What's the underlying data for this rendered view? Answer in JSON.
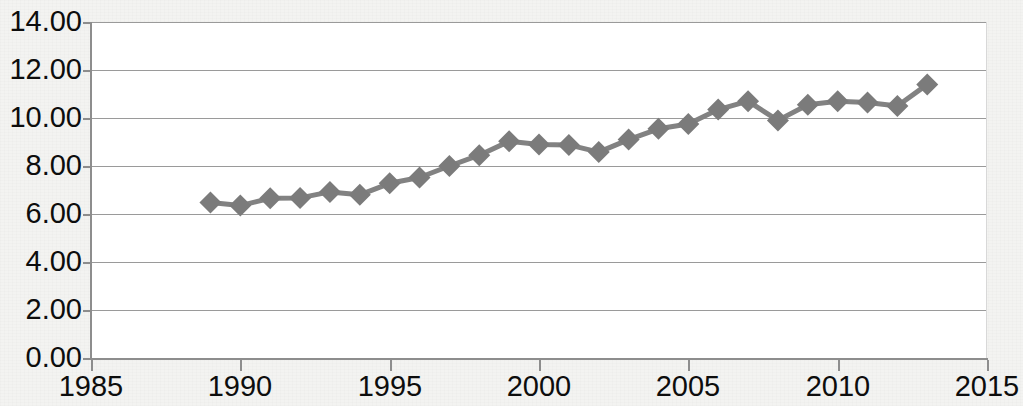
{
  "chart_data": {
    "type": "line",
    "title": "",
    "xlabel": "",
    "ylabel": "",
    "xlim": [
      1985,
      2015
    ],
    "ylim": [
      0,
      14
    ],
    "y_tick_labels": [
      "0.00",
      "2.00",
      "4.00",
      "6.00",
      "8.00",
      "10.00",
      "12.00",
      "14.00"
    ],
    "y_ticks": [
      0,
      2,
      4,
      6,
      8,
      10,
      12,
      14
    ],
    "x_tick_labels": [
      "1985",
      "1990",
      "1995",
      "2000",
      "2005",
      "2010",
      "2015"
    ],
    "x_ticks": [
      1985,
      1990,
      1995,
      2000,
      2005,
      2010,
      2015
    ],
    "grid": "horizontal",
    "legend": "none",
    "marker": "diamond",
    "series_color": "#7b7b7b",
    "line_color": "#828282",
    "series": [
      {
        "name": "series-1",
        "x": [
          1989,
          1990,
          1991,
          1992,
          1993,
          1994,
          1995,
          1996,
          1997,
          1998,
          1999,
          2000,
          2001,
          2002,
          2003,
          2004,
          2005,
          2006,
          2007,
          2008,
          2009,
          2010,
          2011,
          2012,
          2013
        ],
        "values": [
          6.48,
          6.35,
          6.66,
          6.67,
          6.92,
          6.8,
          7.28,
          7.52,
          8.0,
          8.45,
          9.03,
          8.9,
          8.88,
          8.58,
          9.1,
          9.55,
          9.75,
          10.35,
          10.7,
          9.9,
          10.55,
          10.7,
          10.65,
          10.5,
          11.4
        ]
      }
    ]
  }
}
